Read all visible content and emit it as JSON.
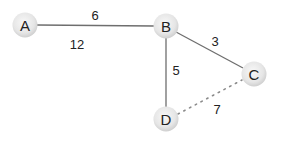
{
  "diagram": {
    "type": "weighted-graph",
    "colors": {
      "node_fill_center": "#f7f7f7",
      "node_fill_edge": "#d4d4d4",
      "edge_solid": "#6e6e6e",
      "edge_dotted": "#8a8a8a",
      "text": "#222222"
    },
    "nodes": [
      {
        "id": "A",
        "label": "A",
        "x": 25,
        "y": 25
      },
      {
        "id": "B",
        "label": "B",
        "x": 166,
        "y": 26
      },
      {
        "id": "C",
        "label": "C",
        "x": 254,
        "y": 74
      },
      {
        "id": "D",
        "label": "D",
        "x": 166,
        "y": 119
      }
    ],
    "edges": [
      {
        "from": "A",
        "to": "B",
        "weight": "6",
        "style": "solid"
      },
      {
        "from": "B",
        "to": "C",
        "weight": "3",
        "style": "solid"
      },
      {
        "from": "B",
        "to": "D",
        "weight": "5",
        "style": "solid"
      },
      {
        "from": "D",
        "to": "C",
        "weight": "7",
        "style": "dotted"
      }
    ],
    "labels": {
      "ab": "6",
      "extra": "12",
      "bc": "3",
      "bd": "5",
      "dc": "7"
    }
  }
}
